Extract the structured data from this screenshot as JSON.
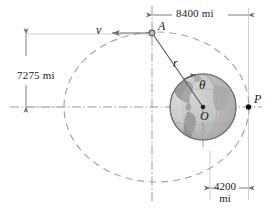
{
  "figure": {
    "type": "orbital-mechanics-diagram"
  },
  "dimensions": {
    "top": {
      "label": "8400 mi",
      "value": 8400,
      "unit": "mi"
    },
    "left": {
      "label": "7275 mi",
      "value": 7275,
      "unit": "mi"
    },
    "bottom_value": "4200",
    "bottom_unit": "mi"
  },
  "points": {
    "apogee": {
      "label": "A"
    },
    "perigee": {
      "label": "P"
    },
    "center": {
      "label": "O"
    }
  },
  "vectors": {
    "velocity": {
      "label": "v"
    },
    "radius": {
      "label": "r"
    },
    "angle": {
      "label": "θ"
    }
  },
  "colors": {
    "line": "#6e6e6e",
    "orbit_dash": "#9a9a9a",
    "earth_light": "#d8d8d8",
    "earth_mid": "#b4b4b4",
    "earth_dark": "#8f8f8f",
    "earth_edge": "#777777",
    "text": "#1a1a1a",
    "thin_line": "#b0b0b0"
  }
}
